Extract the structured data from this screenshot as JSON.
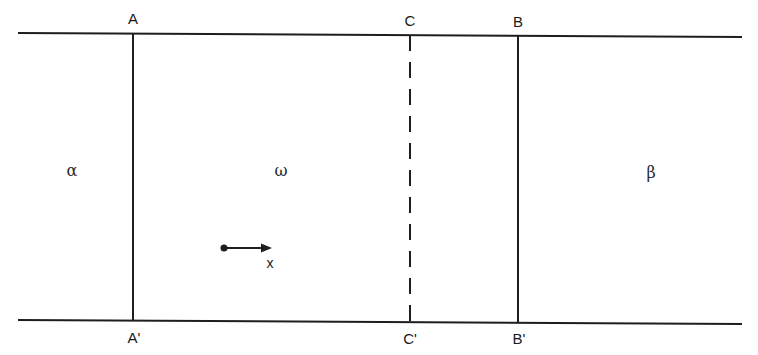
{
  "diagram": {
    "type": "phase-boundary schematic",
    "colors": {
      "line": "#1e1e1e",
      "background": "#ffffff"
    },
    "boundaries": {
      "top": {
        "name": "top-boundary"
      },
      "bottom": {
        "name": "bottom-boundary"
      }
    },
    "interfaces": [
      {
        "id": "A",
        "top_label": "A",
        "bottom_label": "A'",
        "style": "solid"
      },
      {
        "id": "C",
        "top_label": "C",
        "bottom_label": "C'",
        "style": "dashed"
      },
      {
        "id": "B",
        "top_label": "B",
        "bottom_label": "B'",
        "style": "solid"
      }
    ],
    "regions": [
      {
        "id": "alpha",
        "label": "α"
      },
      {
        "id": "omega",
        "label": "ω"
      },
      {
        "id": "beta",
        "label": "β"
      }
    ],
    "axis": {
      "label": "x",
      "direction": "right"
    }
  }
}
